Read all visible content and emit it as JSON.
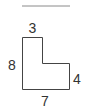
{
  "diagram": {
    "type": "L-shaped polygon with side length labels",
    "labels": {
      "top": "3",
      "left": "8",
      "right": "4",
      "bottom": "7"
    },
    "colors": {
      "stroke": "#444444",
      "text": "#333333",
      "rule": "#888888"
    }
  }
}
